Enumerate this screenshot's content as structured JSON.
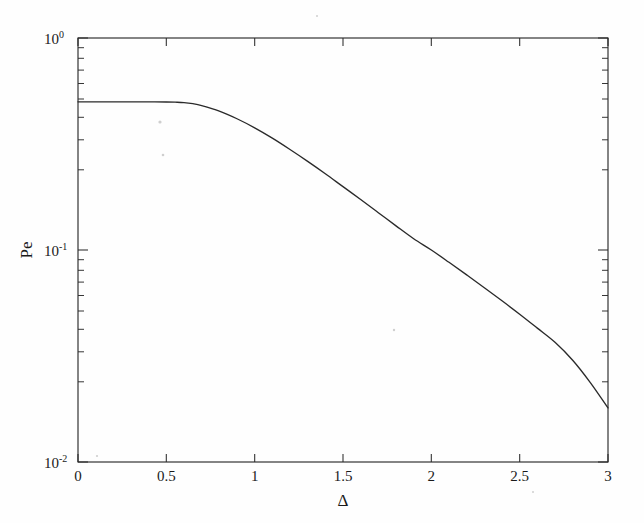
{
  "figure": {
    "background_color": "#fefefe",
    "line_color": "#2a2a2a",
    "axis_color": "#2b2b2b"
  },
  "axes": {
    "x_title": "Δ",
    "y_title": "Pe",
    "x_ticks": [
      "0",
      "0.5",
      "1",
      "1.5",
      "2",
      "2.5",
      "3"
    ],
    "x_tick_values": [
      0,
      0.5,
      1,
      1.5,
      2,
      2.5,
      3
    ],
    "y_ticks": [
      {
        "mantissa": "10",
        "exponent": "0",
        "value": 1
      },
      {
        "mantissa": "10",
        "exponent": "-1",
        "value": 0.1
      },
      {
        "mantissa": "10",
        "exponent": "-2",
        "value": 0.01
      }
    ]
  },
  "chart_data": {
    "type": "line",
    "title": "",
    "xlabel": "Δ",
    "ylabel": "Pe",
    "xscale": "linear",
    "yscale": "log",
    "xlim": [
      0,
      3
    ],
    "ylim": [
      0.01,
      1
    ],
    "grid": false,
    "legend": null,
    "series": [
      {
        "name": "Pe",
        "x": [
          0.0,
          0.1,
          0.2,
          0.3,
          0.4,
          0.5,
          0.55,
          0.6,
          0.65,
          0.7,
          0.8,
          0.9,
          1.0,
          1.1,
          1.2,
          1.3,
          1.4,
          1.5,
          1.6,
          1.7,
          1.8,
          1.9,
          2.0,
          2.1,
          2.2,
          2.3,
          2.4,
          2.5,
          2.6,
          2.7,
          2.8,
          2.9,
          3.0
        ],
        "y": [
          0.5,
          0.5,
          0.5,
          0.5,
          0.5,
          0.499,
          0.498,
          0.496,
          0.49,
          0.48,
          0.452,
          0.416,
          0.377,
          0.337,
          0.298,
          0.262,
          0.229,
          0.199,
          0.173,
          0.15,
          0.13,
          0.113,
          0.1,
          0.0875,
          0.0763,
          0.0664,
          0.0576,
          0.0498,
          0.0428,
          0.0367,
          0.0302,
          0.0237,
          0.018
        ]
      }
    ]
  }
}
